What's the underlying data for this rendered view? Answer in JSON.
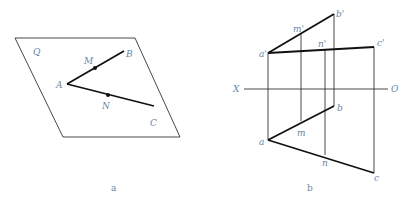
{
  "figure_a": {
    "caption": "a",
    "plane_label": "Q",
    "points": {
      "A": "A",
      "B": "B",
      "C": "C",
      "M": "M",
      "N": "N"
    }
  },
  "figure_b": {
    "caption": "b",
    "axis": {
      "left": "X",
      "right": "O"
    },
    "front_view": {
      "a": "a'",
      "b": "b'",
      "c": "c'",
      "m": "m'",
      "n": "n'"
    },
    "top_view": {
      "a": "a",
      "b": "b",
      "c": "c",
      "m": "m",
      "n": "n"
    }
  },
  "colors": {
    "line": "#111111",
    "thin_line": "#333333",
    "label": "#6a86a6"
  }
}
